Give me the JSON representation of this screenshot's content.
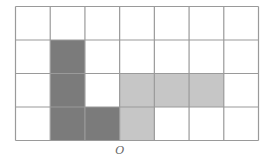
{
  "diagram": {
    "grid": {
      "rows": 4,
      "cols": 7
    },
    "colors": {
      "dark": "#7b7b7b",
      "light": "#c6c6c6",
      "line": "#9a9a9a",
      "background": "#ffffff"
    },
    "dark_cells": [
      [
        1,
        1
      ],
      [
        2,
        1
      ],
      [
        3,
        1
      ],
      [
        3,
        2
      ]
    ],
    "light_cells": [
      [
        2,
        3
      ],
      [
        2,
        4
      ],
      [
        2,
        5
      ],
      [
        3,
        3
      ]
    ],
    "point_label": {
      "text": "O",
      "grid_col_line": 3
    }
  }
}
